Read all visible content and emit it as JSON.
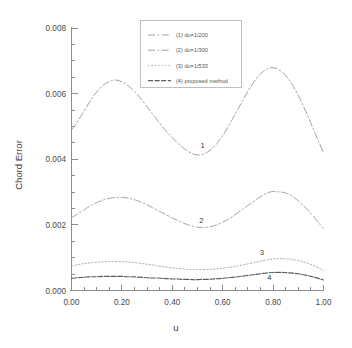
{
  "chart_data": {
    "type": "line",
    "title": "",
    "xlabel": "u",
    "ylabel": "Chord Error",
    "xlim": [
      0.0,
      1.0
    ],
    "ylim": [
      0.0,
      0.008
    ],
    "grid": false,
    "legend_position": "top-center",
    "x_ticks": [
      "0.00",
      "0.20",
      "0.40",
      "0.60",
      "0.80",
      "1.00"
    ],
    "x_tick_values": [
      0.0,
      0.2,
      0.4,
      0.6,
      0.8,
      1.0
    ],
    "x_minor_step": 0.05,
    "y_ticks": [
      "0.000",
      "0.002",
      "0.004",
      "0.006",
      "0.008"
    ],
    "y_tick_values": [
      0.0,
      0.002,
      0.004,
      0.006,
      0.008
    ],
    "y_minor_step": 0.0005,
    "x": [
      0.0,
      0.02,
      0.04,
      0.06,
      0.08,
      0.1,
      0.12,
      0.14,
      0.16,
      0.18,
      0.2,
      0.22,
      0.24,
      0.26,
      0.28,
      0.3,
      0.32,
      0.34,
      0.36,
      0.38,
      0.4,
      0.42,
      0.44,
      0.46,
      0.48,
      0.5,
      0.52,
      0.54,
      0.56,
      0.58,
      0.6,
      0.62,
      0.64,
      0.66,
      0.68,
      0.7,
      0.72,
      0.74,
      0.76,
      0.78,
      0.8,
      0.82,
      0.84,
      0.86,
      0.88,
      0.9,
      0.92,
      0.94,
      0.96,
      0.98,
      1.0
    ],
    "series": [
      {
        "name": "(1) du=1/200",
        "label": "1",
        "label_x": 0.52,
        "label_y": 0.00435,
        "style": "dash-dot",
        "color": "#9a9a9a",
        "values": [
          0.0049,
          0.0051,
          0.00535,
          0.0056,
          0.00585,
          0.00605,
          0.00622,
          0.00633,
          0.0064,
          0.00641,
          0.00636,
          0.00627,
          0.00614,
          0.00598,
          0.0058,
          0.0056,
          0.0054,
          0.0052,
          0.005,
          0.00482,
          0.00466,
          0.0045,
          0.00437,
          0.00425,
          0.00417,
          0.00413,
          0.00415,
          0.00422,
          0.00434,
          0.00451,
          0.00472,
          0.00497,
          0.00524,
          0.00552,
          0.0058,
          0.00607,
          0.00631,
          0.00652,
          0.00667,
          0.00677,
          0.00679,
          0.00674,
          0.00663,
          0.00645,
          0.00622,
          0.00594,
          0.00562,
          0.00528,
          0.00491,
          0.00455,
          0.00421
        ]
      },
      {
        "name": "(2) du=1/300",
        "label": "2",
        "label_x": 0.515,
        "label_y": 0.00205,
        "style": "dash-dot",
        "color": "#9e9e9e",
        "values": [
          0.00222,
          0.00231,
          0.00241,
          0.00251,
          0.0026,
          0.00268,
          0.00274,
          0.00279,
          0.00282,
          0.00284,
          0.00284,
          0.00282,
          0.00279,
          0.00274,
          0.00268,
          0.00261,
          0.00253,
          0.00245,
          0.00237,
          0.00229,
          0.00221,
          0.00214,
          0.00207,
          0.00201,
          0.00196,
          0.00193,
          0.00192,
          0.00193,
          0.00196,
          0.00201,
          0.00208,
          0.00216,
          0.00226,
          0.00237,
          0.00248,
          0.00259,
          0.0027,
          0.00281,
          0.0029,
          0.00298,
          0.00302,
          0.00301,
          0.00299,
          0.00294,
          0.00285,
          0.00273,
          0.00259,
          0.00243,
          0.00226,
          0.00207,
          0.00189
        ]
      },
      {
        "name": "(3) du=1/533",
        "label": "3",
        "label_x": 0.755,
        "label_y": 0.00108,
        "style": "dotted",
        "color": "#a8a8a8",
        "values": [
          0.00075,
          0.00078,
          0.00081,
          0.00083,
          0.00085,
          0.00086,
          0.00087,
          0.00088,
          0.00088,
          0.00088,
          0.00088,
          0.00087,
          0.00086,
          0.00084,
          0.00082,
          0.0008,
          0.00078,
          0.00075,
          0.00073,
          0.00071,
          0.00069,
          0.00067,
          0.00066,
          0.00064,
          0.00064,
          0.00063,
          0.00064,
          0.00064,
          0.00065,
          0.00066,
          0.00068,
          0.0007,
          0.00072,
          0.00075,
          0.00078,
          0.00081,
          0.00084,
          0.00088,
          0.00091,
          0.00094,
          0.00096,
          0.00097,
          0.00097,
          0.00096,
          0.00094,
          0.00091,
          0.00087,
          0.00082,
          0.00076,
          0.00069,
          0.00061
        ]
      },
      {
        "name": "(4) proposed method",
        "label": "4",
        "label_x": 0.785,
        "label_y": 0.00033,
        "style": "solid-dash",
        "color": "#5d5d5d",
        "values": [
          0.00037,
          0.00039,
          0.0004,
          0.00041,
          0.00042,
          0.00042,
          0.00043,
          0.00043,
          0.00043,
          0.00043,
          0.00043,
          0.00042,
          0.00042,
          0.00041,
          0.0004,
          0.00039,
          0.00038,
          0.00038,
          0.00037,
          0.00036,
          0.00035,
          0.00035,
          0.00034,
          0.00034,
          0.00033,
          0.00033,
          0.00034,
          0.00034,
          0.00035,
          0.00036,
          0.00037,
          0.00039,
          0.0004,
          0.00042,
          0.00044,
          0.00046,
          0.00048,
          0.0005,
          0.00052,
          0.00054,
          0.00055,
          0.00055,
          0.00055,
          0.00054,
          0.00053,
          0.00051,
          0.00048,
          0.00045,
          0.00041,
          0.00037,
          0.00032
        ]
      }
    ]
  },
  "legend": {
    "items": [
      {
        "label": "(1) du=1/200"
      },
      {
        "label": "(2) du=1/300"
      },
      {
        "label": "(3) du=1/533"
      },
      {
        "label": "(4) proposed method"
      }
    ]
  },
  "axes": {
    "y_title": "Chord Error",
    "x_title": "u"
  }
}
